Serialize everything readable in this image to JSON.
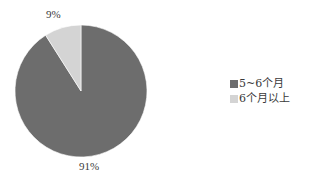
{
  "chart_data": {
    "type": "pie",
    "title": "",
    "categories": [
      "5~6个月",
      "6个月以上"
    ],
    "values": [
      91,
      9
    ],
    "labels": [
      "91%",
      "9%"
    ],
    "colors": [
      "#6d6d6d",
      "#d4d4d4"
    ],
    "start_angle_deg": 0,
    "direction": "clockwise",
    "legend_position": "right"
  },
  "legend": {
    "items": [
      {
        "label": "5~6个月",
        "color": "#6d6d6d"
      },
      {
        "label": "6个月以上",
        "color": "#d4d4d4"
      }
    ]
  },
  "slice_labels": {
    "major": "91%",
    "minor": "9%"
  }
}
